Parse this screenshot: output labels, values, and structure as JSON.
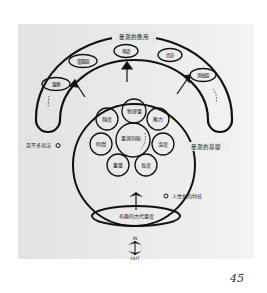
{
  "diagram": {
    "outer_arc_label": "量測的應用",
    "base_arc_label": "量測的基礎",
    "center_label": "量測刻痕",
    "application_nodes": [
      "醫療",
      "電腦圖",
      "導遊",
      "色彩",
      "測繪圖"
    ],
    "quantity_nodes": [
      "物理量",
      "壓力",
      "溫度",
      "長度",
      "重量",
      "時間",
      "頻度"
    ],
    "left_note": "且不多見法",
    "right_note": "人性化的特技",
    "bottom_ellipse_label": "有趣的古代量度",
    "io_in": "IN",
    "io_out": "OUT"
  },
  "page_number": "45"
}
